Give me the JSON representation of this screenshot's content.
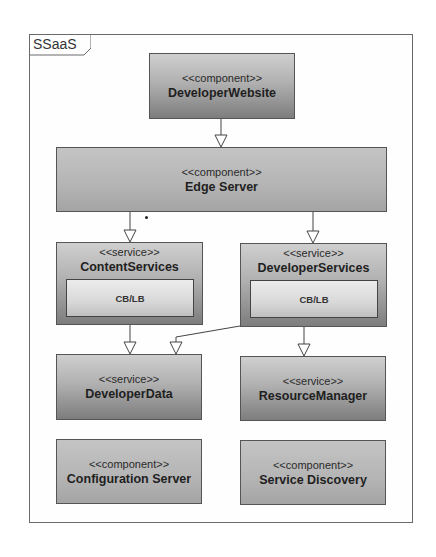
{
  "diagram": {
    "frame": {
      "label": "SSaaS"
    },
    "nodes": {
      "developer_website": {
        "stereotype": "<<component>>",
        "name": "DeveloperWebsite"
      },
      "edge_server": {
        "stereotype": "<<component>>",
        "name": "Edge Server"
      },
      "content_services": {
        "stereotype": "<<service>>",
        "name": "ContentServices",
        "inner": "CB/LB"
      },
      "developer_services": {
        "stereotype": "<<service>>",
        "name": "DeveloperServices",
        "inner": "CB/LB"
      },
      "developer_data": {
        "stereotype": "<<service>>",
        "name": "DeveloperData"
      },
      "resource_manager": {
        "stereotype": "<<service>>",
        "name": "ResourceManager"
      },
      "configuration_server": {
        "stereotype": "<<component>>",
        "name": "Configuration Server"
      },
      "service_discovery": {
        "stereotype": "<<component>>",
        "name": "Service Discovery"
      }
    },
    "edges": [
      {
        "from": "DeveloperWebsite",
        "to": "Edge Server"
      },
      {
        "from": "Edge Server",
        "to": "ContentServices"
      },
      {
        "from": "Edge Server",
        "to": "DeveloperServices"
      },
      {
        "from": "ContentServices",
        "to": "DeveloperData"
      },
      {
        "from": "DeveloperServices",
        "to": "DeveloperData"
      },
      {
        "from": "DeveloperServices",
        "to": "ResourceManager"
      }
    ],
    "colors": {
      "border": "#555555",
      "fill_top": "#cfcfcf",
      "fill_bottom": "#7d7d7d",
      "frame": "#6a6a6a"
    }
  }
}
